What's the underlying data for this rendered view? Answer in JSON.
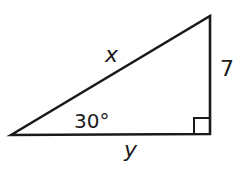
{
  "diagram": {
    "type": "right-triangle",
    "vertices": {
      "left": [
        11,
        135
      ],
      "top_right": [
        210,
        16
      ],
      "bottom_right": [
        210,
        134
      ]
    },
    "labels": {
      "hypotenuse": "x",
      "vertical_leg": "7",
      "angle": "30°",
      "horizontal_leg": "y"
    },
    "right_angle_marker": true,
    "stroke_color": "#1a1a1a"
  }
}
